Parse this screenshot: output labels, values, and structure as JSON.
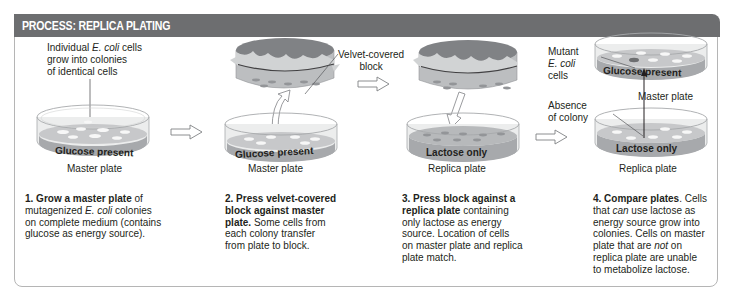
{
  "panel": {
    "title": "PROCESS: REPLICA PLATING",
    "header_color": "#6d6e70",
    "border_color": "#b5b5b5"
  },
  "colors": {
    "plate_glass": "#e6e7e8",
    "medium": "#a7a9ac",
    "colony": "#f1f2f2",
    "velvet": "#bcbec0",
    "block_top": "#808285"
  },
  "step1": {
    "annotation_line1": "Individual ",
    "annotation_italic": "E. coli",
    "annotation_line1_end": " cells",
    "annotation_line2": "grow into colonies",
    "annotation_line3": "of identical cells",
    "medium_label": "Glucose present",
    "plate_caption": "Master plate",
    "text_bold": "1. Grow a master plate",
    "text_a": " of",
    "text_b": "mutagenized ",
    "text_italic": "E. coli",
    "text_c": " colonies",
    "text_d": "on complete medium (contains",
    "text_e": "glucose as energy source)."
  },
  "step2": {
    "medium_label": "Glucose present",
    "plate_caption": "Master plate",
    "text_bold_1": "2. Press velvet-covered",
    "text_bold_2": "block against master",
    "text_bold_3": "plate.",
    "text_a": " Some cells from",
    "text_b": "each colony transfer",
    "text_c": "from plate to block."
  },
  "step3": {
    "annotation_line1": "Velvet-covered",
    "annotation_line2": "block",
    "medium_label": "Lactose only",
    "plate_caption": "Replica plate",
    "text_bold_1": "3. Press block against a",
    "text_bold_2": "replica plate",
    "text_a": " containing",
    "text_b": "only lactose as energy",
    "text_c": "source. Location of cells",
    "text_d": "on master plate and replica",
    "text_e": "plate match."
  },
  "step4": {
    "mutant_line1": "Mutant",
    "mutant_italic": "E. coli",
    "mutant_line3": "cells",
    "absence_line1": "Absence",
    "absence_line2": "of colony",
    "top_medium_label": "Glucose present",
    "top_plate_caption": "Master plate",
    "bottom_medium_label": "Lactose only",
    "bottom_plate_caption": "Replica plate",
    "text_bold": "4. Compare plates",
    "text_a": ". Cells",
    "text_b1": "that ",
    "text_b_italic": "can",
    "text_b2": " use lactose as",
    "text_c": "energy source grow into",
    "text_d": "colonies. Cells on master",
    "text_e1": "plate that are ",
    "text_e_italic": "not",
    "text_e2": " on",
    "text_f": "replica plate are unable",
    "text_g": "to metabolize lactose."
  },
  "arrows": [
    {
      "name": "arrow-step1-to-step2",
      "icon": "outline-right-arrow"
    },
    {
      "name": "arrow-step2-to-step3",
      "icon": "outline-right-arrow"
    },
    {
      "name": "arrow-step3-to-step4",
      "icon": "outline-right-arrow"
    }
  ]
}
